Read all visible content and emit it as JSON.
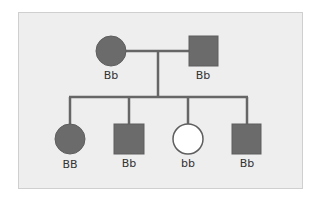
{
  "diagram": {
    "type": "pedigree",
    "colors": {
      "affected_fill": "#6b6b6b",
      "unaffected_fill": "#ffffff",
      "outline": "#5e5e5e",
      "line": "#666666",
      "background": "#eeeeee",
      "border": "#cfcfcf"
    },
    "parents": [
      {
        "id": "mother",
        "sex": "female",
        "affected": true,
        "genotype": "Bb"
      },
      {
        "id": "father",
        "sex": "male",
        "affected": true,
        "genotype": "Bb"
      }
    ],
    "children": [
      {
        "id": "child1",
        "sex": "female",
        "affected": true,
        "genotype": "BB"
      },
      {
        "id": "child2",
        "sex": "male",
        "affected": true,
        "genotype": "Bb"
      },
      {
        "id": "child3",
        "sex": "female",
        "affected": false,
        "genotype": "bb"
      },
      {
        "id": "child4",
        "sex": "male",
        "affected": true,
        "genotype": "Bb"
      }
    ]
  }
}
